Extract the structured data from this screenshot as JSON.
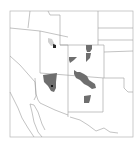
{
  "map": {
    "region": "Southwestern United States (Four Corners)",
    "colors": {
      "background": "#ffffff",
      "state_border": "#9a9a9a",
      "highlight": "#6e6e6e",
      "marker": "#111111",
      "frame": "#b5b5b5"
    },
    "states_shown": [
      "Nevada",
      "Utah",
      "Colorado",
      "Wyoming",
      "Arizona",
      "New Mexico",
      "California",
      "Texas",
      "Oklahoma",
      "Kansas",
      "Nebraska",
      "Idaho"
    ],
    "highlighted_areas": [
      {
        "name": "north-central Utah",
        "state": "Utah",
        "has_marker": true
      },
      {
        "name": "northwestern Colorado",
        "state": "Colorado",
        "has_marker": false
      },
      {
        "name": "west-central Colorado",
        "state": "Colorado",
        "has_marker": false
      },
      {
        "name": "central Arizona",
        "state": "Arizona",
        "has_marker": true
      },
      {
        "name": "north-central New Mexico",
        "state": "New Mexico",
        "has_marker": false
      },
      {
        "name": "south-central New Mexico",
        "state": "New Mexico",
        "has_marker": false
      }
    ]
  }
}
